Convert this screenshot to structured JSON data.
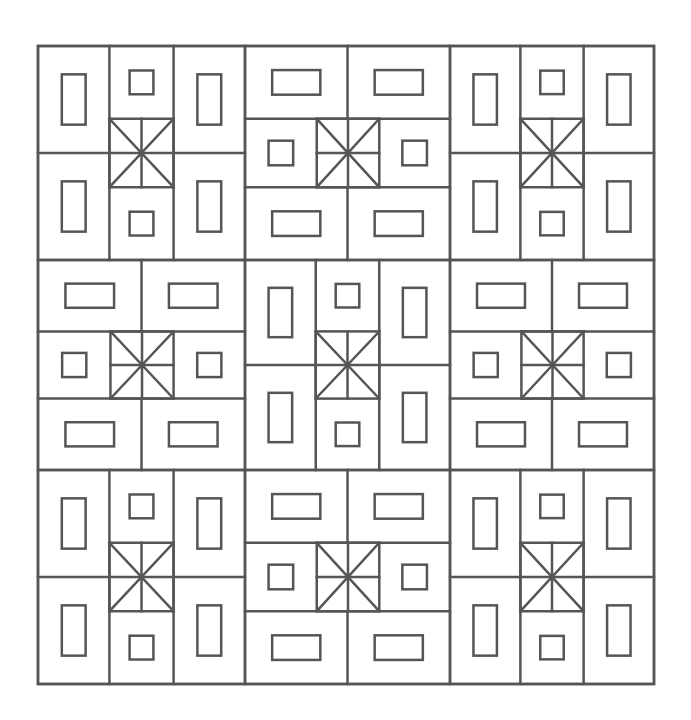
{
  "diagram": {
    "type": "quilt-pattern-coloring-page",
    "line_color": "#555555",
    "background": "#ffffff",
    "stroke_width": 2.5,
    "frame": {
      "x": 38,
      "y": 46,
      "width": 616,
      "height": 638
    },
    "grid": {
      "cols": [
        38,
        245,
        450,
        654
      ],
      "rows": [
        46,
        260,
        470,
        684
      ]
    },
    "blocks": [
      [
        "A",
        "B",
        "A"
      ],
      [
        "B",
        "A",
        "B"
      ],
      [
        "A",
        "B",
        "A"
      ]
    ],
    "block_types": {
      "A": "vertical: tall rectangles in left/right columns, small squares top/bottom center, star square center",
      "B": "horizontal: wide rectangles in top/bottom rows, small squares left/right middle, star square center"
    }
  }
}
